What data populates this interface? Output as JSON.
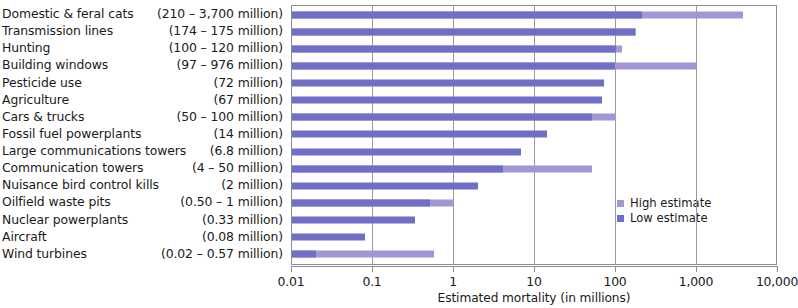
{
  "chart_data": {
    "type": "bar",
    "orientation": "horizontal",
    "title": "",
    "xlabel": "Estimated mortality (in millions)",
    "ylabel": "",
    "xscale": "log",
    "xlim": [
      0.01,
      10000
    ],
    "xticks": [
      0.01,
      0.1,
      1,
      10,
      100,
      1000,
      10000
    ],
    "xticklabels": [
      "0.01",
      "0.1",
      "1",
      "10",
      "100",
      "1,000",
      "10,000"
    ],
    "grid": true,
    "legend_position": "inside-right",
    "legend": [
      {
        "label": "High estimate",
        "color": "#a296d4"
      },
      {
        "label": "Low estimate",
        "color": "#6f6fc6"
      }
    ],
    "categories": [
      "Domestic & feral cats",
      "Transmission lines",
      "Hunting",
      "Building windows",
      "Pesticide use",
      "Agriculture",
      "Cars & trucks",
      "Fossil fuel powerplants",
      "Large communications towers",
      "Communication towers",
      "Nuisance bird control kills",
      "Oilfield waste pits",
      "Nuclear powerplants",
      "Aircraft",
      "Wind turbines"
    ],
    "range_labels": [
      "(210 – 3,700 million)",
      "(174 – 175 million)",
      "(100 – 120 million)",
      "(97 – 976 million)",
      "(72 million)",
      "(67 million)",
      "(50 – 100 million)",
      "(14 million)",
      "(6.8 million)",
      "(4 – 50 million)",
      "(2 million)",
      "(0.50 – 1 million)",
      "(0.33 million)",
      "(0.08 million)",
      "(0.02 – 0.57 million)"
    ],
    "series": [
      {
        "name": "Low estimate",
        "values": [
          210,
          174,
          100,
          97,
          72,
          67,
          50,
          14,
          6.8,
          4,
          2,
          0.5,
          0.33,
          0.08,
          0.02
        ]
      },
      {
        "name": "High estimate",
        "values": [
          3700,
          175,
          120,
          976,
          72,
          67,
          100,
          14,
          6.8,
          50,
          2,
          1,
          0.33,
          0.08,
          0.57
        ]
      }
    ]
  }
}
